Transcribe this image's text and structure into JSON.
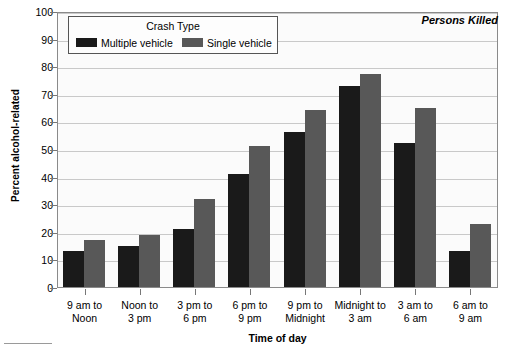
{
  "chart_data": {
    "type": "bar",
    "title": "",
    "annotation": "Persons Killed",
    "xlabel": "Time of day",
    "ylabel": "Percent alcohol-related",
    "ylim": [
      0,
      100
    ],
    "ytick_step": 10,
    "grid": true,
    "legend_title": "Crash Type",
    "legend_position": "top-left-inside",
    "categories": [
      "9 am to\nNoon",
      "Noon to\n3 pm",
      "3 pm to\n6 pm",
      "6 pm to\n9 pm",
      "9 pm to\nMidnight",
      "Midnight to\n3 am",
      "3 am to\n6 am",
      "6 am to\n9 am"
    ],
    "category_lines": [
      [
        "9 am to",
        "Noon"
      ],
      [
        "Noon to",
        "3 pm"
      ],
      [
        "3 pm to",
        "6 pm"
      ],
      [
        "6 pm to",
        "9 pm"
      ],
      [
        "9 pm to",
        "Midnight"
      ],
      [
        "Midnight to",
        "3 am"
      ],
      [
        "3 am to",
        "6 am"
      ],
      [
        "6 am to",
        "9 am"
      ]
    ],
    "yticks": [
      0,
      10,
      20,
      30,
      40,
      50,
      60,
      70,
      80,
      90,
      100
    ],
    "series": [
      {
        "name": "Multiple vehicle",
        "color": "#1a1a1a",
        "values": [
          13,
          15,
          21,
          41,
          56,
          73,
          52,
          13
        ]
      },
      {
        "name": "Single vehicle",
        "color": "#585858",
        "values": [
          17,
          19,
          32,
          51,
          64,
          77,
          65,
          23
        ]
      }
    ]
  },
  "colors": {
    "multiple_vehicle": "#1a1a1a",
    "single_vehicle": "#585858",
    "plot_background": "#fbfbfb",
    "gridline": "#c9c9c9",
    "frame": "#8a8a8a"
  }
}
